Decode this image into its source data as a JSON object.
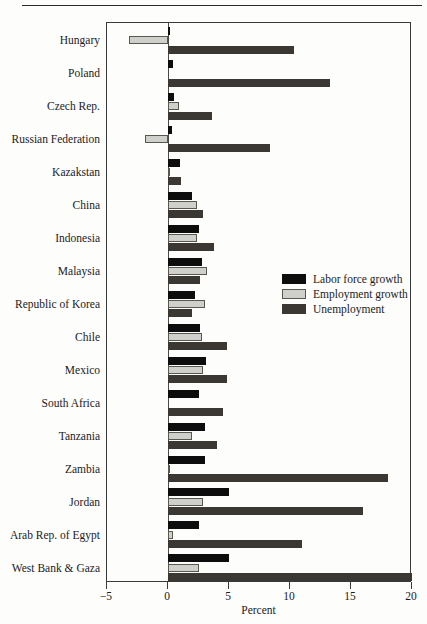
{
  "chart_data": {
    "type": "bar",
    "orientation": "horizontal",
    "title": "",
    "xlabel": "Percent",
    "ylabel": "",
    "xlim": [
      -5,
      20
    ],
    "xticks": [
      -5,
      0,
      5,
      10,
      15,
      20
    ],
    "xtick_labels": [
      "−5",
      "0",
      "5",
      "10",
      "15",
      "20"
    ],
    "grid": false,
    "legend_position": "middle-right",
    "categories": [
      "Hungary",
      "Poland",
      "Czech Rep.",
      "Russian Federation",
      "Kazakstan",
      "China",
      "Indonesia",
      "Malaysia",
      "Republic of Korea",
      "Chile",
      "Mexico",
      "South Africa",
      "Tanzania",
      "Zambia",
      "Jordan",
      "Arab Rep. of Egypt",
      "West Bank & Gaza"
    ],
    "series": [
      {
        "name": "Labor force growth",
        "color": "#0d0d0d",
        "values": [
          0.2,
          0.4,
          0.5,
          0.3,
          1.0,
          2.0,
          2.5,
          2.8,
          2.2,
          2.6,
          3.1,
          2.5,
          3.0,
          3.0,
          5.0,
          2.5,
          5.0
        ]
      },
      {
        "name": "Employment growth",
        "color": "#cfcfcb",
        "values": [
          -3.2,
          0.0,
          0.9,
          -1.9,
          0.1,
          2.4,
          2.4,
          3.2,
          3.0,
          2.8,
          2.9,
          0.0,
          2.0,
          0.1,
          2.9,
          0.4,
          2.5
        ]
      },
      {
        "name": "Unemployment",
        "color": "#3b3733",
        "values": [
          10.3,
          13.3,
          3.6,
          8.4,
          1.1,
          2.9,
          3.8,
          2.6,
          2.0,
          4.8,
          4.8,
          4.5,
          4.0,
          18.0,
          16.0,
          11.0,
          20.0
        ]
      }
    ]
  }
}
